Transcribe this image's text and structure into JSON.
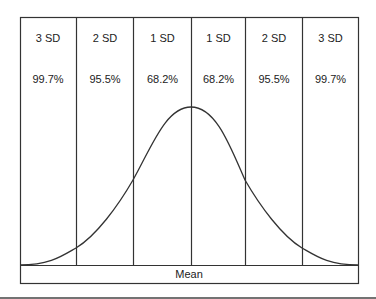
{
  "diagram": {
    "columns": [
      {
        "sd": "3 SD",
        "pct": "99.7%"
      },
      {
        "sd": "2 SD",
        "pct": "95.5%"
      },
      {
        "sd": "1 SD",
        "pct": "68.2%"
      },
      {
        "sd": "1 SD",
        "pct": "68.2%"
      },
      {
        "sd": "2 SD",
        "pct": "95.5%"
      },
      {
        "sd": "3 SD",
        "pct": "99.7%"
      }
    ],
    "footer_label": "Mean",
    "colors": {
      "line": "#333333",
      "text": "#222222",
      "background": "#ffffff"
    }
  }
}
